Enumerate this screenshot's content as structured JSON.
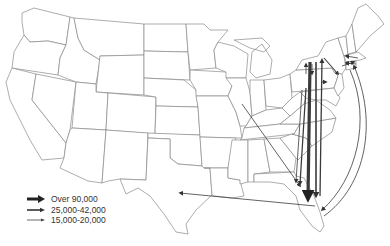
{
  "map": {
    "subject": "United States state outline map with migration flow arrows",
    "base_color": "#ffffff",
    "border_color": "#8a8a8a",
    "arrow_color": "#3a3a3a"
  },
  "legend": {
    "items": [
      {
        "label": "Over 90,000",
        "weight": "thick",
        "stroke_width": 3.2
      },
      {
        "label": "25,000-42,000",
        "weight": "medium",
        "stroke_width": 1.6
      },
      {
        "label": "15,000-20,000",
        "weight": "thin",
        "stroke_width": 0.8
      }
    ]
  },
  "flows": [
    {
      "from": "New York",
      "to": "Florida",
      "category": "Over 90,000"
    },
    {
      "from": "New York",
      "to": "Florida",
      "category": "25,000-42,000",
      "note": "parallel"
    },
    {
      "from": "Florida",
      "to": "New York",
      "category": "25,000-42,000"
    },
    {
      "from": "New Jersey",
      "to": "Florida",
      "category": "25,000-42,000"
    },
    {
      "from": "Pennsylvania",
      "to": "Florida",
      "category": "15,000-20,000"
    },
    {
      "from": "Illinois",
      "to": "Florida",
      "category": "15,000-20,000"
    },
    {
      "from": "Florida",
      "to": "Texas",
      "category": "15,000-20,000"
    },
    {
      "from": "Massachusetts",
      "to": "Florida",
      "category": "15,000-20,000",
      "note": "coastal curve"
    },
    {
      "from": "Florida",
      "to": "Massachusetts",
      "category": "15,000-20,000",
      "note": "coastal curve"
    },
    {
      "from": "New York",
      "to": "New Jersey",
      "category": "15,000-20,000"
    },
    {
      "from": "New York",
      "to": "Pennsylvania",
      "category": "15,000-20,000"
    },
    {
      "from": "New York",
      "to": "Connecticut",
      "category": "15,000-20,000"
    },
    {
      "from": "New York",
      "to": "Massachusetts",
      "category": "15,000-20,000"
    },
    {
      "from": "Massachusetts",
      "to": "New Hampshire",
      "category": "15,000-20,000"
    },
    {
      "from": "Pennsylvania",
      "to": "New Jersey",
      "category": "15,000-20,000"
    }
  ]
}
